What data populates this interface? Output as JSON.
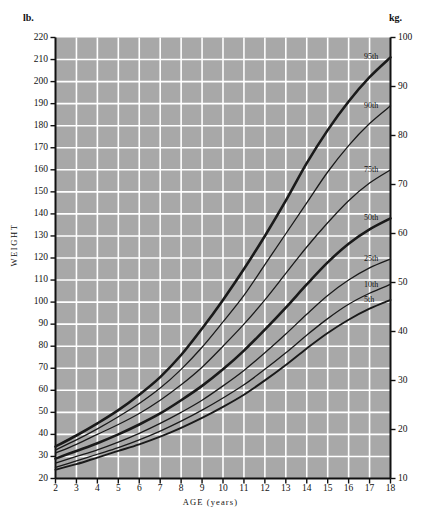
{
  "chart_data": {
    "type": "line",
    "title": "",
    "xlabel": "AGE  (years)",
    "ylabel": "WEIGHT",
    "left_unit": "lb.",
    "right_unit": "kg.",
    "xlim": [
      2,
      18
    ],
    "ylim_lb": [
      20,
      220
    ],
    "ylim_kg": [
      10,
      100
    ],
    "grid": true,
    "legend_position": "right-inline-curve-labels",
    "x_tick_labels": [
      "2",
      "3",
      "4",
      "5",
      "6",
      "7",
      "8",
      "9",
      "10",
      "11",
      "12",
      "13",
      "14",
      "15",
      "16",
      "17",
      "18"
    ],
    "x_ticks": [
      2,
      3,
      4,
      5,
      6,
      7,
      8,
      9,
      10,
      11,
      12,
      13,
      14,
      15,
      16,
      17,
      18
    ],
    "y_left_tick_labels": [
      "20",
      "30",
      "40",
      "50",
      "60",
      "70",
      "80",
      "90",
      "100",
      "110",
      "120",
      "130",
      "140",
      "150",
      "160",
      "170",
      "180",
      "190",
      "200",
      "210",
      "220"
    ],
    "y_left_ticks": [
      20,
      30,
      40,
      50,
      60,
      70,
      80,
      90,
      100,
      110,
      120,
      130,
      140,
      150,
      160,
      170,
      180,
      190,
      200,
      210,
      220
    ],
    "y_right_tick_labels": [
      "10",
      "20",
      "30",
      "40",
      "50",
      "60",
      "70",
      "80",
      "90",
      "100"
    ],
    "y_right_ticks": [
      10,
      20,
      30,
      40,
      50,
      60,
      70,
      80,
      90,
      100
    ],
    "x": [
      2,
      3,
      4,
      5,
      6,
      7,
      8,
      9,
      10,
      11,
      12,
      13,
      14,
      15,
      16,
      17,
      18
    ],
    "series": [
      {
        "name": "95th",
        "label": "95th",
        "emphasis": "heavy",
        "values": [
          34.5,
          39.5,
          45.0,
          51.0,
          58.0,
          66.0,
          76.0,
          88.0,
          101.0,
          115.0,
          130.0,
          146.0,
          163.0,
          178.0,
          191.0,
          202.0,
          211.0
        ]
      },
      {
        "name": "90th",
        "label": "90th",
        "emphasis": "light",
        "values": [
          33.0,
          37.5,
          42.5,
          48.0,
          54.0,
          61.0,
          69.5,
          79.5,
          91.0,
          103.0,
          117.0,
          131.0,
          145.0,
          159.0,
          171.0,
          181.0,
          189.0
        ]
      },
      {
        "name": "75th",
        "label": "75th",
        "emphasis": "light",
        "values": [
          31.5,
          35.5,
          40.0,
          44.5,
          49.5,
          55.5,
          62.5,
          70.5,
          80.0,
          90.0,
          101.0,
          113.0,
          125.0,
          136.0,
          146.0,
          154.0,
          160.0
        ]
      },
      {
        "name": "50th",
        "label": "50th",
        "emphasis": "heavy",
        "values": [
          29.0,
          32.5,
          36.0,
          40.0,
          44.5,
          49.5,
          55.5,
          62.0,
          69.5,
          78.0,
          87.5,
          97.5,
          108.0,
          118.0,
          126.5,
          133.0,
          138.0
        ]
      },
      {
        "name": "25th",
        "label": "25th",
        "emphasis": "light",
        "values": [
          27.0,
          30.0,
          33.0,
          36.5,
          40.5,
          45.0,
          50.0,
          55.5,
          62.0,
          69.0,
          77.0,
          85.5,
          94.5,
          103.0,
          110.0,
          115.5,
          119.5
        ]
      },
      {
        "name": "10th",
        "label": "10th",
        "emphasis": "light",
        "values": [
          25.0,
          28.0,
          31.0,
          34.0,
          37.5,
          41.5,
          46.0,
          51.0,
          56.5,
          62.5,
          69.5,
          77.0,
          85.0,
          92.5,
          99.0,
          104.0,
          108.0
        ]
      },
      {
        "name": "5th",
        "label": "5th",
        "emphasis": "heavy-thin",
        "values": [
          24.0,
          26.5,
          29.5,
          32.5,
          35.5,
          39.0,
          43.0,
          47.5,
          52.5,
          58.0,
          64.5,
          71.5,
          79.0,
          86.0,
          92.0,
          97.0,
          101.0
        ]
      }
    ]
  },
  "colors": {
    "plot_background": "#a8a8a8",
    "grid_line": "#ffffff",
    "curve": "#1a1a1a",
    "axis": "#111111",
    "text": "#111111",
    "page_background": "#ffffff"
  }
}
